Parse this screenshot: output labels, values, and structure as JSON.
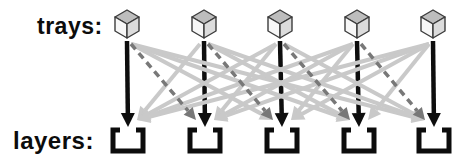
{
  "labels": {
    "trays": "trays:",
    "layers": "layers:"
  },
  "diagram": {
    "width": 467,
    "height": 163,
    "tray_count": 5,
    "layer_count": 5,
    "tray_x": [
      127,
      204,
      280,
      357,
      433
    ],
    "layer_x": [
      128,
      205,
      282,
      359,
      434
    ],
    "cube": {
      "top_y": 10,
      "side_top_y": 17,
      "mid_y": 24,
      "side_bottom_y": 31,
      "bottom_y": 38,
      "half_w": 12
    },
    "cube_colors": {
      "top": "#bdbdbd",
      "left": "#f7f7f7",
      "right": "#dcdcdc",
      "outline": "#3c3c3c"
    },
    "bracket": {
      "top_y": 130,
      "bottom_y": 151,
      "half_w": 15,
      "tick": 7,
      "stroke": 5,
      "color": "#0c0c0c"
    },
    "arrows": {
      "start_y": 41,
      "diag_start_y": 44,
      "black_tip_y": 127,
      "diag_tip_y": 120,
      "start_dx": 4,
      "tip_dx": 9
    },
    "styles": {
      "black": {
        "color": "#0e0e0e",
        "width": 4.5,
        "dash": "",
        "head_len": 14,
        "head_w": 14
      },
      "dark": {
        "color": "#787878",
        "width": 3.5,
        "dash": "7 5",
        "head_len": 12,
        "head_w": 12
      },
      "light": {
        "color": "#c9c9c9",
        "width": 4,
        "dash": "",
        "head_len": 13,
        "head_w": 13
      }
    },
    "edges": [
      {
        "from": 1,
        "to": 1,
        "style": "black"
      },
      {
        "from": 2,
        "to": 2,
        "style": "black"
      },
      {
        "from": 3,
        "to": 3,
        "style": "black"
      },
      {
        "from": 4,
        "to": 4,
        "style": "black"
      },
      {
        "from": 5,
        "to": 5,
        "style": "black"
      },
      {
        "from": 1,
        "to": 2,
        "style": "dark"
      },
      {
        "from": 2,
        "to": 3,
        "style": "dark"
      },
      {
        "from": 3,
        "to": 4,
        "style": "dark"
      },
      {
        "from": 4,
        "to": 5,
        "style": "dark"
      },
      {
        "from": 1,
        "to": 3,
        "style": "light"
      },
      {
        "from": 1,
        "to": 4,
        "style": "light"
      },
      {
        "from": 1,
        "to": 5,
        "style": "light"
      },
      {
        "from": 2,
        "to": 1,
        "style": "light"
      },
      {
        "from": 2,
        "to": 4,
        "style": "light"
      },
      {
        "from": 2,
        "to": 5,
        "style": "light"
      },
      {
        "from": 3,
        "to": 1,
        "style": "light"
      },
      {
        "from": 3,
        "to": 2,
        "style": "light"
      },
      {
        "from": 3,
        "to": 5,
        "style": "light"
      },
      {
        "from": 4,
        "to": 1,
        "style": "light"
      },
      {
        "from": 4,
        "to": 2,
        "style": "light"
      },
      {
        "from": 4,
        "to": 3,
        "style": "light"
      },
      {
        "from": 5,
        "to": 1,
        "style": "light"
      },
      {
        "from": 5,
        "to": 2,
        "style": "light"
      },
      {
        "from": 5,
        "to": 3,
        "style": "light"
      },
      {
        "from": 5,
        "to": 4,
        "style": "light"
      }
    ]
  }
}
